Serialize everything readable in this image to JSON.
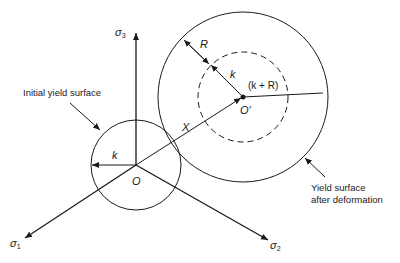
{
  "diagram": {
    "axes": {
      "sigma1": {
        "symbol": "σ",
        "sub": "1"
      },
      "sigma2": {
        "symbol": "σ",
        "sub": "2"
      },
      "sigma3": {
        "symbol": "σ",
        "sub": "3"
      }
    },
    "labels": {
      "initial_surface": "Initial yield surface",
      "after_line1": "Yield surface",
      "after_line2": "after deformation",
      "origin": "O",
      "new_origin": "O′",
      "k_initial": "k",
      "k_new": "k",
      "R": "R",
      "k_plus_R": "(k + R)",
      "X": "X"
    },
    "colors": {
      "stroke": "#1a1a1a",
      "background": "#ffffff"
    }
  }
}
